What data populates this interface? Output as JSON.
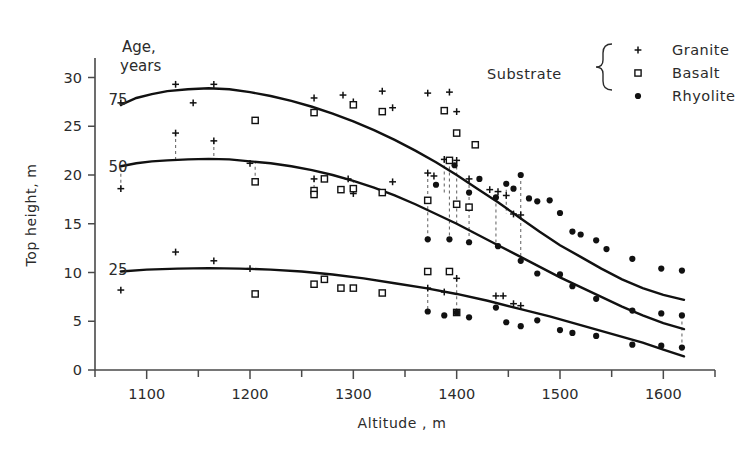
{
  "chart_data": {
    "type": "scatter",
    "title": "",
    "xlabel": "Altitude , m",
    "ylabel": "Top height, m",
    "xlim": [
      1050,
      1650
    ],
    "ylim": [
      0,
      32
    ],
    "x_ticks": [
      1100,
      1200,
      1300,
      1400,
      1500,
      1600
    ],
    "x_minor_ticks": [
      1050,
      1150,
      1250,
      1350,
      1450,
      1550,
      1650
    ],
    "y_ticks": [
      0,
      5,
      10,
      15,
      20,
      25,
      30
    ],
    "grid": false,
    "legend_position": "top-right",
    "legend_title": "Substrate",
    "legend": [
      {
        "label": "Granite",
        "marker": "plus"
      },
      {
        "label": "Basalt",
        "marker": "open-square"
      },
      {
        "label": "Rhyolite",
        "marker": "filled-circle"
      }
    ],
    "age_label": "Age,\nyears",
    "age_label_line1": "Age,",
    "age_label_line2": "years",
    "curve_labels": [
      "75",
      "50",
      "25"
    ],
    "curves": [
      {
        "name": "age-75",
        "label": "75",
        "points": [
          [
            1075,
            27.2
          ],
          [
            1090,
            27.9
          ],
          [
            1105,
            28.3
          ],
          [
            1120,
            28.6
          ],
          [
            1140,
            28.8
          ],
          [
            1160,
            28.9
          ],
          [
            1180,
            28.8
          ],
          [
            1200,
            28.5
          ],
          [
            1220,
            28.1
          ],
          [
            1240,
            27.6
          ],
          [
            1260,
            27.0
          ],
          [
            1280,
            26.3
          ],
          [
            1300,
            25.5
          ],
          [
            1320,
            24.6
          ],
          [
            1340,
            23.6
          ],
          [
            1360,
            22.5
          ],
          [
            1380,
            21.3
          ],
          [
            1400,
            20.0
          ],
          [
            1420,
            18.6
          ],
          [
            1440,
            17.2
          ],
          [
            1460,
            15.7
          ],
          [
            1480,
            14.2
          ],
          [
            1500,
            12.8
          ],
          [
            1520,
            11.6
          ],
          [
            1540,
            10.4
          ],
          [
            1560,
            9.3
          ],
          [
            1580,
            8.4
          ],
          [
            1600,
            7.7
          ],
          [
            1620,
            7.2
          ]
        ]
      },
      {
        "name": "age-50",
        "label": "50",
        "points": [
          [
            1075,
            20.9
          ],
          [
            1090,
            21.2
          ],
          [
            1105,
            21.4
          ],
          [
            1120,
            21.5
          ],
          [
            1140,
            21.6
          ],
          [
            1160,
            21.65
          ],
          [
            1180,
            21.6
          ],
          [
            1200,
            21.4
          ],
          [
            1220,
            21.2
          ],
          [
            1240,
            20.9
          ],
          [
            1260,
            20.5
          ],
          [
            1280,
            20.0
          ],
          [
            1300,
            19.4
          ],
          [
            1320,
            18.7
          ],
          [
            1340,
            17.9
          ],
          [
            1360,
            17.0
          ],
          [
            1380,
            16.0
          ],
          [
            1400,
            15.0
          ],
          [
            1420,
            13.9
          ],
          [
            1440,
            12.8
          ],
          [
            1460,
            11.7
          ],
          [
            1480,
            10.6
          ],
          [
            1500,
            9.5
          ],
          [
            1520,
            8.5
          ],
          [
            1540,
            7.5
          ],
          [
            1560,
            6.5
          ],
          [
            1580,
            5.6
          ],
          [
            1600,
            4.8
          ],
          [
            1620,
            4.2
          ]
        ]
      },
      {
        "name": "age-25",
        "label": "25",
        "points": [
          [
            1075,
            10.1
          ],
          [
            1100,
            10.3
          ],
          [
            1130,
            10.4
          ],
          [
            1160,
            10.45
          ],
          [
            1190,
            10.4
          ],
          [
            1220,
            10.3
          ],
          [
            1250,
            10.1
          ],
          [
            1280,
            9.8
          ],
          [
            1310,
            9.4
          ],
          [
            1340,
            8.9
          ],
          [
            1370,
            8.4
          ],
          [
            1400,
            7.8
          ],
          [
            1430,
            7.1
          ],
          [
            1460,
            6.3
          ],
          [
            1490,
            5.5
          ],
          [
            1520,
            4.6
          ],
          [
            1550,
            3.7
          ],
          [
            1580,
            2.8
          ],
          [
            1600,
            2.1
          ],
          [
            1620,
            1.4
          ]
        ]
      }
    ],
    "series": [
      {
        "name": "Granite",
        "marker": "plus",
        "points": [
          [
            1075,
            27.4
          ],
          [
            1128,
            29.3
          ],
          [
            1145,
            27.4
          ],
          [
            1165,
            29.3
          ],
          [
            1262,
            27.9
          ],
          [
            1290,
            28.2
          ],
          [
            1300,
            27.5
          ],
          [
            1328,
            28.6
          ],
          [
            1338,
            26.9
          ],
          [
            1372,
            28.4
          ],
          [
            1393,
            28.5
          ],
          [
            1400,
            26.5
          ],
          [
            1075,
            18.6
          ],
          [
            1128,
            24.3
          ],
          [
            1165,
            23.5
          ],
          [
            1200,
            21.2
          ],
          [
            1262,
            19.6
          ],
          [
            1295,
            19.6
          ],
          [
            1300,
            18.1
          ],
          [
            1338,
            19.3
          ],
          [
            1372,
            20.2
          ],
          [
            1378,
            19.9
          ],
          [
            1388,
            21.6
          ],
          [
            1400,
            21.5
          ],
          [
            1412,
            19.6
          ],
          [
            1432,
            18.5
          ],
          [
            1440,
            18.3
          ],
          [
            1448,
            17.9
          ],
          [
            1455,
            16.0
          ],
          [
            1462,
            15.9
          ],
          [
            1075,
            8.2
          ],
          [
            1128,
            12.1
          ],
          [
            1165,
            11.2
          ],
          [
            1200,
            10.4
          ],
          [
            1372,
            8.4
          ],
          [
            1388,
            8.0
          ],
          [
            1400,
            9.4
          ],
          [
            1438,
            7.6
          ],
          [
            1445,
            7.6
          ],
          [
            1455,
            6.8
          ],
          [
            1462,
            6.6
          ]
        ]
      },
      {
        "name": "Basalt",
        "marker": "open-square",
        "points": [
          [
            1205,
            25.6
          ],
          [
            1262,
            26.4
          ],
          [
            1300,
            27.2
          ],
          [
            1328,
            26.5
          ],
          [
            1388,
            26.6
          ],
          [
            1400,
            24.3
          ],
          [
            1418,
            23.1
          ],
          [
            1205,
            19.3
          ],
          [
            1262,
            18.4
          ],
          [
            1262,
            18.0
          ],
          [
            1272,
            19.6
          ],
          [
            1288,
            18.5
          ],
          [
            1300,
            18.6
          ],
          [
            1328,
            18.2
          ],
          [
            1372,
            17.4
          ],
          [
            1393,
            21.5
          ],
          [
            1400,
            17.0
          ],
          [
            1412,
            16.7
          ],
          [
            1205,
            7.8
          ],
          [
            1262,
            8.8
          ],
          [
            1272,
            9.3
          ],
          [
            1288,
            8.4
          ],
          [
            1300,
            8.4
          ],
          [
            1328,
            7.9
          ],
          [
            1372,
            10.1
          ],
          [
            1393,
            10.1
          ],
          [
            1400,
            5.9
          ]
        ]
      },
      {
        "name": "Rhyolite",
        "marker": "filled-circle",
        "points": [
          [
            1380,
            19.0
          ],
          [
            1398,
            21.0
          ],
          [
            1412,
            18.2
          ],
          [
            1422,
            19.6
          ],
          [
            1438,
            17.7
          ],
          [
            1448,
            19.1
          ],
          [
            1455,
            18.6
          ],
          [
            1462,
            20.0
          ],
          [
            1470,
            17.6
          ],
          [
            1478,
            17.3
          ],
          [
            1490,
            17.4
          ],
          [
            1500,
            16.1
          ],
          [
            1512,
            14.2
          ],
          [
            1520,
            13.9
          ],
          [
            1535,
            13.3
          ],
          [
            1545,
            12.4
          ],
          [
            1570,
            11.4
          ],
          [
            1598,
            10.4
          ],
          [
            1618,
            10.2
          ],
          [
            1372,
            13.4
          ],
          [
            1393,
            13.4
          ],
          [
            1412,
            13.1
          ],
          [
            1440,
            12.7
          ],
          [
            1462,
            11.2
          ],
          [
            1478,
            9.9
          ],
          [
            1500,
            9.8
          ],
          [
            1512,
            8.6
          ],
          [
            1535,
            7.3
          ],
          [
            1570,
            6.1
          ],
          [
            1598,
            5.8
          ],
          [
            1618,
            5.6
          ],
          [
            1372,
            6.0
          ],
          [
            1388,
            5.6
          ],
          [
            1400,
            5.9
          ],
          [
            1412,
            5.4
          ],
          [
            1438,
            6.4
          ],
          [
            1448,
            4.9
          ],
          [
            1462,
            4.5
          ],
          [
            1478,
            5.1
          ],
          [
            1500,
            4.1
          ],
          [
            1512,
            3.8
          ],
          [
            1535,
            3.5
          ],
          [
            1570,
            2.6
          ],
          [
            1598,
            2.5
          ],
          [
            1618,
            2.3
          ]
        ]
      }
    ],
    "connectors": [
      [
        1075,
        18.6,
        1075,
        20.9
      ],
      [
        1128,
        24.3,
        1128,
        21.5
      ],
      [
        1165,
        23.5,
        1165,
        21.6
      ],
      [
        1205,
        19.3,
        1205,
        21.4
      ],
      [
        1262,
        19.6,
        1262,
        18.0
      ],
      [
        1300,
        18.6,
        1300,
        19.4
      ],
      [
        1372,
        17.4,
        1372,
        13.4
      ],
      [
        1372,
        20.2,
        1372,
        17.4
      ],
      [
        1388,
        21.6,
        1388,
        18.0
      ],
      [
        1393,
        21.5,
        1393,
        13.4
      ],
      [
        1400,
        21.5,
        1400,
        15.0
      ],
      [
        1412,
        19.6,
        1412,
        13.1
      ],
      [
        1438,
        17.7,
        1438,
        12.7
      ],
      [
        1462,
        20.0,
        1462,
        11.2
      ],
      [
        1618,
        5.6,
        1618,
        2.3
      ],
      [
        1448,
        19.1,
        1448,
        16.0
      ],
      [
        1372,
        8.4,
        1372,
        6.0
      ],
      [
        1400,
        9.4,
        1400,
        5.9
      ]
    ]
  },
  "axes": {
    "y_tick_labels": [
      "30",
      "25",
      "20",
      "15",
      "10",
      "5",
      "0"
    ],
    "x_tick_labels": [
      "1100",
      "1200",
      "1300",
      "1400",
      "1500",
      "1600"
    ],
    "y_axis_title": "Top height, m",
    "x_axis_title": "Altitude , m"
  },
  "colors": {
    "ink": "#111111",
    "axis": "#4a4a4a",
    "connector": "#6d6d6d",
    "background": "#ffffff"
  }
}
